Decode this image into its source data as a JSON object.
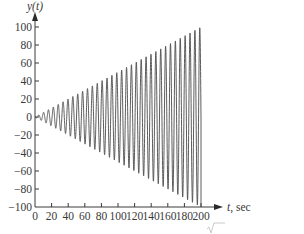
{
  "chart_data": {
    "type": "line",
    "title": "",
    "xlabel": "t, sec",
    "ylabel": "y(t)",
    "xlim": [
      0,
      200
    ],
    "ylim": [
      -100,
      100
    ],
    "grid": false,
    "legend": null,
    "x_ticks": [
      0,
      20,
      40,
      60,
      80,
      100,
      120,
      140,
      160,
      180,
      200
    ],
    "y_ticks": [
      100,
      80,
      60,
      40,
      20,
      0,
      -20,
      -40,
      -60,
      -80,
      -100
    ],
    "x_tick_labels": [
      "0",
      "20",
      "40",
      "60",
      "80",
      "100",
      "120",
      "140",
      "160",
      "180",
      "200"
    ],
    "y_tick_labels": [
      "100",
      "80",
      "60",
      "40",
      "20",
      "0",
      "−20",
      "−40",
      "−60",
      "−80",
      "−100"
    ],
    "series": [
      {
        "name": "y(t)",
        "description": "Oscillation with linearly growing amplitude (resonance); envelope ~ 0.5*t, reaching ~100 at t=200, then dropping to -100",
        "envelope_slope": 0.5,
        "cycles": 34,
        "t_start": 0,
        "t_end": 200,
        "color": "#4a4a4a"
      }
    ],
    "annotations": [
      "√k (partial fragment below chart)"
    ]
  },
  "labels": {
    "y_axis": "y(t)",
    "x_axis_var": "t",
    "x_axis_unit": ", sec",
    "fragment": "√"
  }
}
